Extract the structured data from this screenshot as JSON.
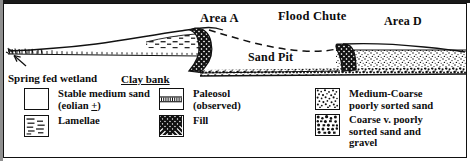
{
  "figure": {
    "type": "geologic-cross-section",
    "labels": {
      "area_a": "Area A",
      "flood_chute": "Flood Chute",
      "area_d": "Area D",
      "sand_pit": "Sand Pit",
      "spring_fed_wetland": "Spring fed wetland",
      "clay_bank": "Clay bank"
    }
  },
  "legend": {
    "items": [
      {
        "key": "stable-medium-sand",
        "pattern": "blank",
        "line1": "Stable medium sand",
        "line2_pre": "(eolian ",
        "line2_sym": "+",
        "line2_post": ")"
      },
      {
        "key": "lamellae",
        "pattern": "dashes",
        "line1": "Lamellae",
        "line2": ""
      },
      {
        "key": "paleosol-observed",
        "pattern": "paleosol",
        "line1": "Paleosol",
        "line2": "(observed)"
      },
      {
        "key": "fill",
        "pattern": "crosshatch",
        "line1": "Fill",
        "line2": ""
      },
      {
        "key": "medium-coarse-poorly-sorted-sand",
        "pattern": "stipple-medium",
        "line1": "Medium-Coarse",
        "line2": "poorly sorted sand",
        "line3": ""
      },
      {
        "key": "coarse-very-poorly-sorted-sand-and-gravel",
        "pattern": "stipple-coarse",
        "line1": "Coarse v. poorly",
        "line2": "sorted sand and",
        "line3": "gravel"
      }
    ]
  },
  "colors": {
    "ink": "#0d0d0d",
    "frame": "#111111",
    "paper": "#ffffff",
    "bar": "#1a1a1a",
    "edge": "#8f8f8f"
  }
}
